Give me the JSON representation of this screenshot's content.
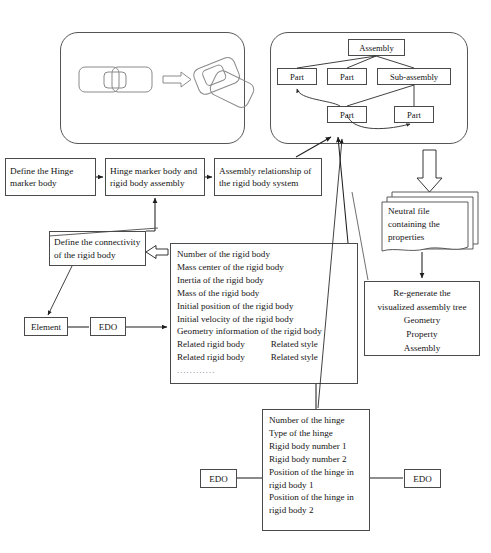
{
  "figure": {
    "line_color": "#4a4a4a",
    "text_color": "#141414",
    "background": "#ffffff"
  },
  "illustration_panel": {
    "caption": "assembly of two rigid parts into an exploded pose"
  },
  "assembly_tree_panel": {
    "root": "Assembly",
    "level2": [
      {
        "label": "Part"
      },
      {
        "label": "Part"
      },
      {
        "label": "Sub-assembly"
      }
    ],
    "level3": [
      {
        "label": "Part"
      },
      {
        "label": "Part"
      }
    ]
  },
  "process_row": {
    "step1": {
      "line1": "Define the Hinge",
      "line2": "marker body"
    },
    "step2": {
      "line1": "Hinge marker body and",
      "line2": "rigid body assembly"
    },
    "step3": {
      "line1": "Assembly relationship of",
      "line2": "the rigid body system"
    }
  },
  "connectivity": {
    "line1": "Define the connectivity",
    "line2": "of the rigid body"
  },
  "small_nodes": {
    "element": "Element",
    "edo_left": "EDO",
    "edo_hinge_left": "EDO",
    "edo_hinge_right": "EDO"
  },
  "rigid_body_properties": {
    "rows": [
      {
        "text": "Number of the rigid body"
      },
      {
        "text": "Mass center of the rigid body"
      },
      {
        "text": "Inertia of the rigid body"
      },
      {
        "text": "Mass of the rigid body"
      },
      {
        "text": "Initial position of the rigid body"
      },
      {
        "text": "Initial velocity of the rigid body"
      },
      {
        "text": "Geometry information of the rigid body"
      },
      {
        "text": "Related rigid body",
        "col2": "Related style"
      },
      {
        "text": "Related rigid body",
        "col2": "Related style"
      }
    ],
    "ellipsis": "............"
  },
  "hinge_properties": {
    "rows": [
      {
        "text": "Number of the hinge"
      },
      {
        "text": "Type of the hinge"
      },
      {
        "text": "Rigid body number 1"
      },
      {
        "text": "Rigid body number 2"
      },
      {
        "text": "Position of the hinge in"
      },
      {
        "text": "rigid body 1"
      },
      {
        "text": "Position of the hinge in"
      },
      {
        "text": "rigid body 2"
      }
    ]
  },
  "neutral_file": {
    "line1": "Neutral file",
    "line2": "containing the",
    "line3": "properties"
  },
  "regenerate": {
    "line1": "Re-generate the",
    "line2": "visualized assembly tree",
    "line3": "Geometry",
    "line4": "Property",
    "line5": "Assembly"
  }
}
